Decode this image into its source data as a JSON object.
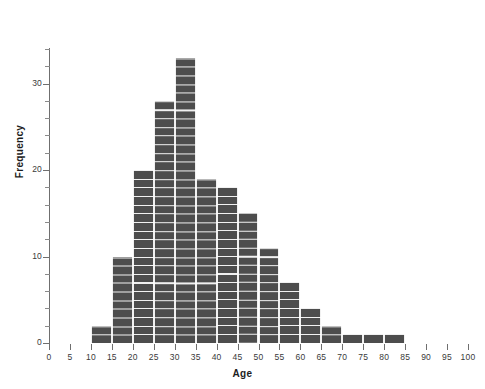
{
  "chart_data": {
    "type": "bar",
    "title": "",
    "subtitle": "",
    "xlabel": "Age",
    "ylabel": "Frequency",
    "xlim": [
      0,
      100
    ],
    "ylim": [
      0,
      35
    ],
    "grid": true,
    "legend": null,
    "bin_width": 5,
    "categories": [
      "10-15",
      "15-20",
      "20-25",
      "25-30",
      "30-35",
      "35-40",
      "40-45",
      "45-50",
      "50-55",
      "55-60",
      "60-65",
      "65-70",
      "70-75",
      "75-80",
      "80-85"
    ],
    "bin_starts": [
      10,
      15,
      20,
      25,
      30,
      35,
      40,
      45,
      50,
      55,
      60,
      65,
      70,
      75,
      80
    ],
    "values": [
      2,
      10,
      20,
      28,
      33,
      19,
      18,
      15,
      11,
      7,
      4,
      2,
      1,
      1,
      1
    ],
    "x_tick_labels": [
      "0",
      "5",
      "10",
      "15",
      "20",
      "25",
      "30",
      "35",
      "40",
      "45",
      "50",
      "55",
      "60",
      "65",
      "70",
      "75",
      "80",
      "85",
      "90",
      "95",
      "100"
    ],
    "x_ticks": [
      0,
      5,
      10,
      15,
      20,
      25,
      30,
      35,
      40,
      45,
      50,
      55,
      60,
      65,
      70,
      75,
      80,
      85,
      90,
      95,
      100
    ],
    "y_tick_labels": [
      "0",
      "10",
      "20",
      "30"
    ],
    "y_ticks": [
      0,
      10,
      20,
      30
    ],
    "y_minor_ticks": [
      2,
      4,
      6,
      8,
      12,
      14,
      16,
      18,
      22,
      24,
      26,
      28,
      32,
      34
    ],
    "bar_color": "#4d4d4d",
    "grid_color": "#ffffff",
    "axis_color": "#6f6f6f",
    "text_color": "#1d1d1d",
    "background": "#ffffff"
  }
}
